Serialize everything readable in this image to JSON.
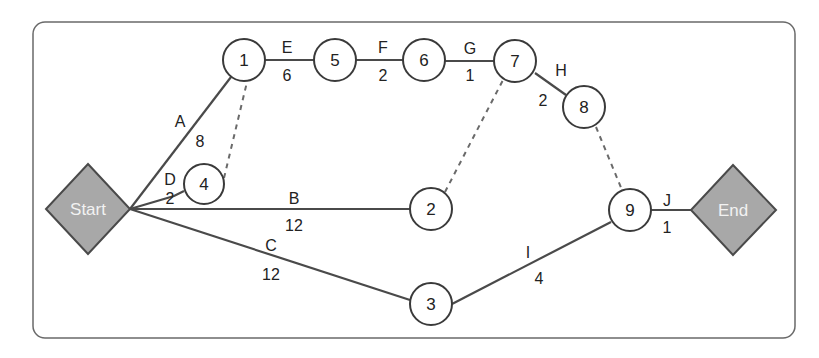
{
  "diagram": {
    "type": "activity-on-arrow network",
    "terminals": {
      "start": "Start",
      "end": "End"
    },
    "nodes": {
      "n1": "1",
      "n2": "2",
      "n3": "3",
      "n4": "4",
      "n5": "5",
      "n6": "6",
      "n7": "7",
      "n8": "8",
      "n9": "9"
    },
    "activities": {
      "A": {
        "label": "A",
        "duration": "8",
        "from": "Start",
        "to": "1"
      },
      "B": {
        "label": "B",
        "duration": "12",
        "from": "Start",
        "to": "2"
      },
      "C": {
        "label": "C",
        "duration": "12",
        "from": "Start",
        "to": "3"
      },
      "D": {
        "label": "D",
        "duration": "2",
        "from": "Start",
        "to": "4"
      },
      "E": {
        "label": "E",
        "duration": "6",
        "from": "1",
        "to": "5"
      },
      "F": {
        "label": "F",
        "duration": "2",
        "from": "5",
        "to": "6"
      },
      "G": {
        "label": "G",
        "duration": "1",
        "from": "6",
        "to": "7"
      },
      "H": {
        "label": "H",
        "duration": "2",
        "from": "7",
        "to": "8"
      },
      "I": {
        "label": "I",
        "duration": "4",
        "from": "3",
        "to": "9"
      },
      "J": {
        "label": "J",
        "duration": "1",
        "from": "9",
        "to": "End"
      }
    },
    "dummy_dependencies": [
      {
        "from": "4",
        "to": "1"
      },
      {
        "from": "2",
        "to": "7"
      },
      {
        "from": "8",
        "to": "9"
      }
    ],
    "colors": {
      "terminal_fill": "#a8a8a8",
      "line": "#4a4a4a",
      "frame": "#6a6a6a"
    }
  }
}
